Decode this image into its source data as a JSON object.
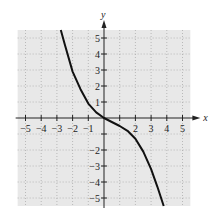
{
  "chart_data": {
    "type": "line",
    "title": "",
    "xlabel": "x",
    "ylabel": "y",
    "xlim": [
      -5.5,
      5.5
    ],
    "ylim": [
      -5.5,
      5.5
    ],
    "grid": true,
    "x_ticks": [
      -5,
      -4,
      -3,
      -2,
      -1,
      1,
      2,
      3,
      4,
      5
    ],
    "y_ticks": [
      -5,
      -4,
      -3,
      -2,
      -1,
      1,
      2,
      3,
      4,
      5
    ],
    "x_tick_labels": [
      "−5",
      "−4",
      "−3",
      "−2",
      "−1",
      "",
      "2",
      "3",
      "4",
      "5"
    ],
    "y_tick_labels": [
      "−5",
      "−4",
      "−3",
      "−2",
      "",
      "1",
      "2",
      "3",
      "4",
      "5"
    ],
    "series": [
      {
        "name": "curve",
        "x": [
          -2.75,
          -2.5,
          -2.0,
          -1.5,
          -1.0,
          -0.5,
          0,
          0.5,
          1.0,
          1.5,
          2.0,
          2.5,
          3.0,
          3.4,
          3.8
        ],
        "y": [
          5.5,
          4.6,
          2.9,
          1.8,
          0.9,
          0.35,
          0,
          -0.25,
          -0.5,
          -0.8,
          -1.3,
          -2.1,
          -3.2,
          -4.3,
          -5.5
        ]
      }
    ]
  }
}
